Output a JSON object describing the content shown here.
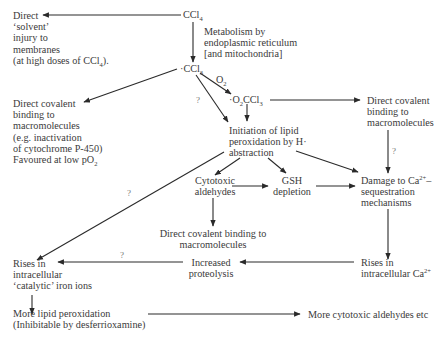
{
  "diagram": {
    "nodes": {
      "ccl4": {
        "text": "CCl",
        "sub": "4"
      },
      "solvent_injury": {
        "lines": [
          "Direct",
          "‘solvent’",
          "injury to",
          "membranes",
          "(at high doses of CCl"
        ],
        "last_sub": "4",
        "last_tail": ")."
      },
      "metabolism": {
        "lines": [
          "Metabolism by",
          "endoplasmic reticulum",
          "[and mitochondria]"
        ]
      },
      "ccl3_radical": {
        "prefix": "·",
        "text": "CCl",
        "sub": "3"
      },
      "o2_label": {
        "text": "O",
        "sub": "2"
      },
      "o2ccl3_radical": {
        "prefix": "·",
        "text_a": "O",
        "sub_a": "2",
        "text_b": "CCl",
        "sub_b": "3"
      },
      "covalent_left": {
        "lines": [
          "Direct covalent",
          "binding to",
          "macromolecules",
          "(e.g. inactivation",
          "of cytochrome P-450)",
          "Favoured at low pO"
        ],
        "last_sub": "2"
      },
      "covalent_right": {
        "lines": [
          "Direct covalent",
          "binding to",
          "macromolecules"
        ]
      },
      "lipid_initiation": {
        "lines": [
          "Initiation of lipid",
          "peroxidation by H·",
          "abstraction"
        ]
      },
      "cytotoxic_aldehydes": {
        "lines": [
          "Cytotoxic",
          "aldehydes"
        ]
      },
      "gsh_depletion": {
        "lines": [
          "GSH",
          "depletion"
        ]
      },
      "ca_damage": {
        "line1": "Damage to Ca",
        "sup": "2+",
        "line1_tail": "–",
        "lines_rest": [
          "sequestration",
          "mechanisms"
        ]
      },
      "covalent_center": {
        "lines": [
          "Direct covalent binding to",
          "macromolecules"
        ]
      },
      "iron_ions": {
        "lines": [
          "Rises in",
          "intracellular",
          "‘catalytic’ iron ions"
        ]
      },
      "proteolysis": {
        "lines": [
          "Increased",
          "proteolysis"
        ]
      },
      "ca_rise": {
        "line1": "Rises in",
        "line2": "intracellular Ca",
        "sup": "2+"
      },
      "more_lipid": {
        "lines": [
          "More lipid peroxidation",
          "(Inhibitable by desferrioxamine)"
        ]
      },
      "more_aldehydes": {
        "text": "More cytotoxic aldehydes etc"
      }
    },
    "uncertain_marks": [
      "?",
      "?",
      "?",
      "?"
    ],
    "colors": {
      "line": "#2a2a2a",
      "text": "#3a3a3a",
      "background": "#ffffff"
    }
  }
}
